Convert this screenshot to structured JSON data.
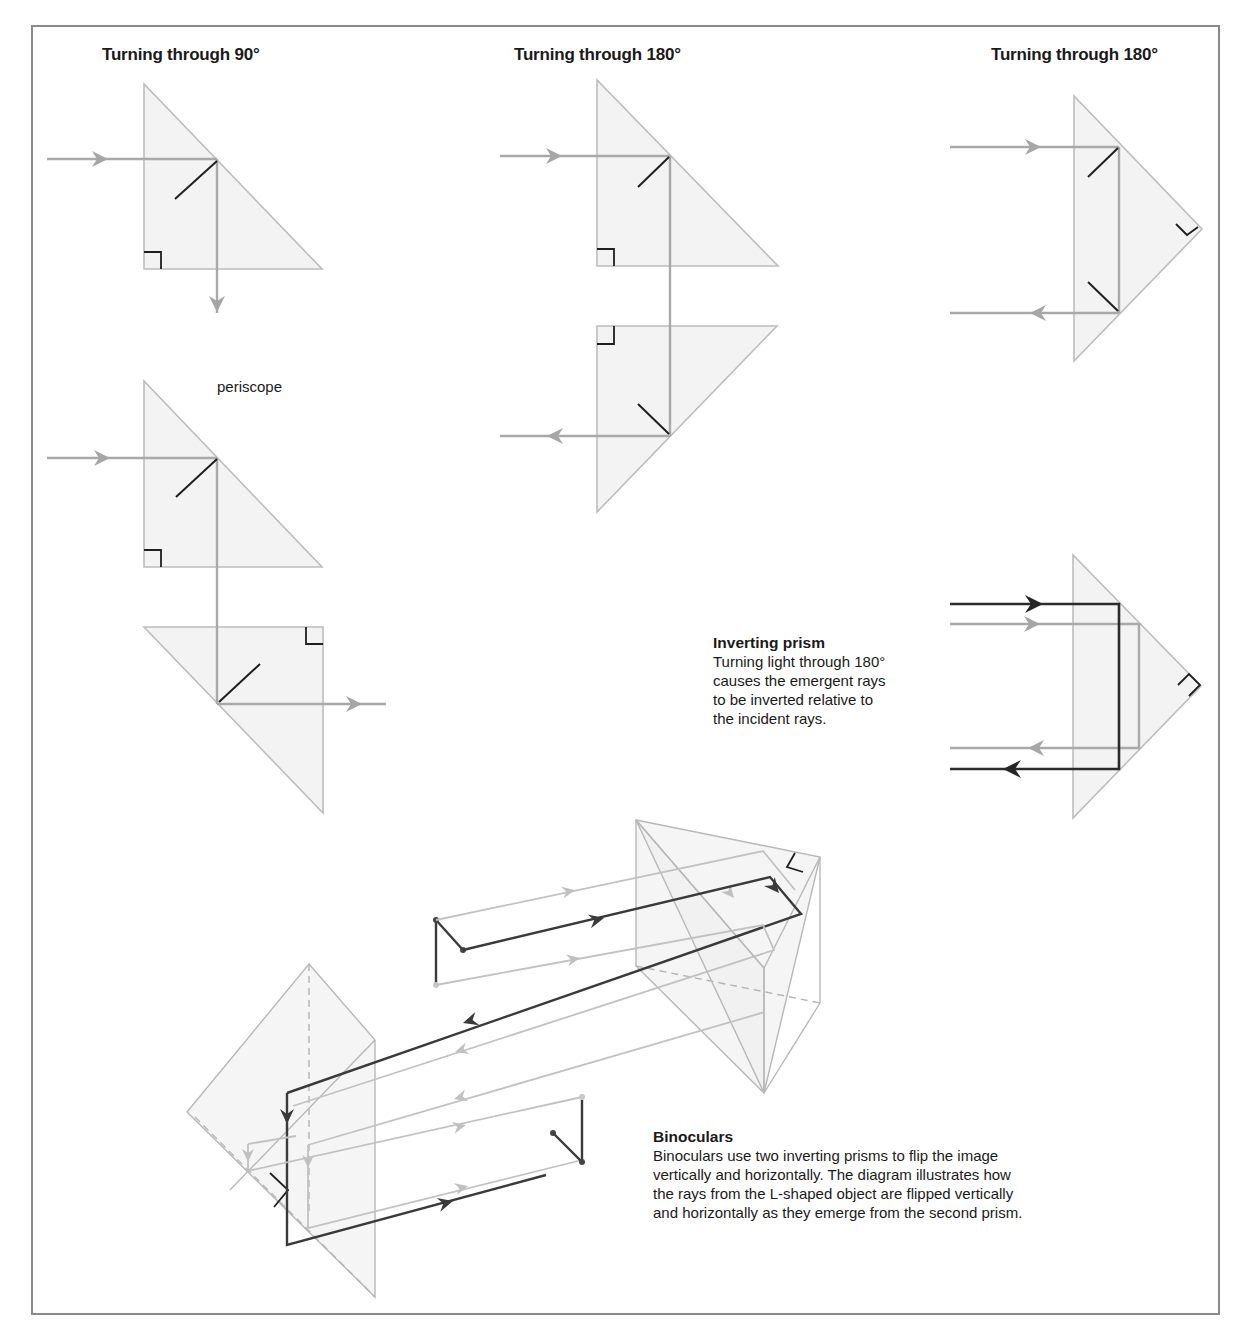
{
  "figure": {
    "panels": [
      {
        "id": "turn90",
        "heading": "Turning through 90°",
        "sublabel": "periscope"
      },
      {
        "id": "turn180a",
        "heading": "Turning through 180°"
      },
      {
        "id": "turn180b",
        "heading": "Turning through 180°"
      }
    ],
    "inverting_prism": {
      "title": "Inverting prism",
      "lines": [
        "Turning light through 180°",
        "causes the emergent rays",
        "to be inverted relative to",
        "the incident rays."
      ]
    },
    "binoculars": {
      "title": "Binoculars",
      "lines": [
        "Binoculars use two inverting prisms to flip the image",
        "vertically and horizontally. The diagram illustrates how",
        "the rays from the L-shaped object are flipped vertically",
        "and horizontally as they emerge from the second prism."
      ]
    }
  },
  "icons": {
    "arrowhead": "triangle",
    "right_angle_marker": "square-corner"
  },
  "colors": {
    "prism_fill": "#efefef",
    "prism_stroke": "#bdbdbd",
    "ray_gray": "#a9a9a9",
    "ray_dark": "#2b2b2b",
    "frame_border": "#8a8a8a"
  }
}
